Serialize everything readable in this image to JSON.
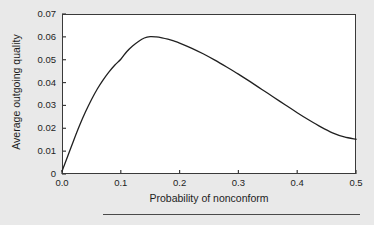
{
  "chart_data": {
    "type": "line",
    "title": "",
    "subtitle": "",
    "xlabel": "Probability of nonconform",
    "ylabel": "Average outgoing quality",
    "xlim": [
      0.0,
      0.5
    ],
    "ylim": [
      0.0,
      0.07
    ],
    "grid": false,
    "legend": null,
    "xticks": [
      "0.0",
      "0.1",
      "0.2",
      "0.3",
      "0.4",
      "0.5"
    ],
    "xtick_values": [
      0.0,
      0.1,
      0.2,
      0.3,
      0.4,
      0.5
    ],
    "yticks": [
      "0",
      "0.01",
      "0.02",
      "0.03",
      "0.04",
      "0.05",
      "0.06",
      "0.07"
    ],
    "ytick_values": [
      0.0,
      0.01,
      0.02,
      0.03,
      0.04,
      0.05,
      0.06,
      0.07
    ],
    "series": [
      {
        "name": "Average outgoing quality",
        "color": "#202020",
        "x": [
          0.0,
          0.01,
          0.02,
          0.03,
          0.04,
          0.05,
          0.06,
          0.07,
          0.08,
          0.09,
          0.1,
          0.11,
          0.12,
          0.13,
          0.14,
          0.15,
          0.16,
          0.17,
          0.18,
          0.19,
          0.2,
          0.22,
          0.24,
          0.26,
          0.28,
          0.3,
          0.32,
          0.34,
          0.36,
          0.38,
          0.4,
          0.42,
          0.44,
          0.46,
          0.48,
          0.5
        ],
        "y": [
          0.0012,
          0.008,
          0.0148,
          0.0213,
          0.0272,
          0.0325,
          0.0372,
          0.0412,
          0.0447,
          0.0477,
          0.0502,
          0.0535,
          0.056,
          0.058,
          0.0595,
          0.0601,
          0.06,
          0.0596,
          0.059,
          0.0582,
          0.0573,
          0.0551,
          0.0526,
          0.0498,
          0.0468,
          0.0437,
          0.0404,
          0.037,
          0.0336,
          0.0302,
          0.0268,
          0.0236,
          0.0206,
          0.018,
          0.0162,
          0.0152
        ]
      }
    ],
    "annotations": {
      "peak_x": 0.15,
      "peak_y": 0.06,
      "endpoint_x": 0.5,
      "endpoint_y": 0.015
    },
    "style": {
      "plot_background": "#ffffff",
      "figure_background": "#e9e9e9",
      "axis_color": "#3a3a3a",
      "line_color": "#202020",
      "tick_direction": "in"
    }
  },
  "footer": {
    "rule_visible": true
  }
}
